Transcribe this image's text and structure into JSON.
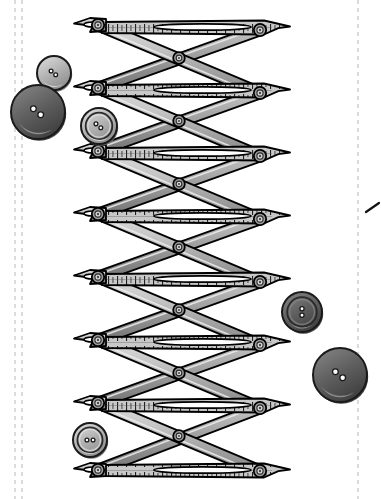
{
  "canvas": {
    "width": 381,
    "height": 499,
    "background": "#ffffff",
    "title": "Lazy-tongs scissor extension mechanism with sewing buttons"
  },
  "palette": {
    "outline": "#000000",
    "metal_light": "#d9d9d9",
    "metal_mid": "#b3b3b3",
    "metal_dark": "#8c8c8c",
    "metal_shadow": "#6e6e6e",
    "slot_white": "#ffffff",
    "button_light_face": "#b5b5b5",
    "button_light_rim": "#9a9a9a",
    "button_dark_face": "#5f5f5f",
    "button_dark_rim": "#4a4a4a",
    "button_highlight": "#cfcfcf",
    "hole_white": "#ffffff",
    "guide_dash": "#c9c9c9"
  },
  "guides": {
    "label": "dashed cutting guides",
    "lines": [
      {
        "name": "left-guide-outer",
        "x": 15,
        "y1": 0,
        "y2": 499
      },
      {
        "name": "left-guide-inner",
        "x": 22,
        "y1": 0,
        "y2": 499
      },
      {
        "name": "right-guide",
        "x": 358,
        "y1": 0,
        "y2": 499
      }
    ],
    "tick_mark": {
      "name": "corner-tick",
      "x1": 366,
      "y1": 212,
      "x2": 379,
      "y2": 204
    }
  },
  "mechanism": {
    "name": "lazy-tongs",
    "segments": 7,
    "left_pivot_x": 98,
    "right_pivot_x": 260,
    "center_pivot_x": 179,
    "left_joints_y": [
      25,
      88,
      151,
      214,
      277,
      340,
      403,
      470
    ],
    "right_joints_y": [
      30,
      93,
      156,
      219,
      282,
      345,
      408,
      471
    ],
    "center_joints_y": [
      58,
      121,
      184,
      247,
      310,
      373,
      436
    ],
    "arm_width": 11,
    "tip_left_x": 78,
    "tip_right_x": 318,
    "rivet_label": "pivot-rivet",
    "ruler_ticks_label": "scale-graduations"
  },
  "buttons": [
    {
      "name": "button-small-light-top",
      "cx": 54,
      "cy": 73,
      "r": 17,
      "style": "light",
      "rim": false,
      "holes": 2,
      "hole_layout": "diagonal",
      "label": "2-hole light button"
    },
    {
      "name": "button-large-dark-left",
      "cx": 38,
      "cy": 112,
      "r": 27,
      "style": "dark",
      "rim": false,
      "holes": 2,
      "hole_layout": "diagonal",
      "label": "2-hole large dark button"
    },
    {
      "name": "button-ringed-light-upper",
      "cx": 99,
      "cy": 126,
      "r": 18,
      "style": "light",
      "rim": true,
      "holes": 2,
      "hole_layout": "diagonal",
      "label": "2-hole ringed light button"
    },
    {
      "name": "button-medium-dark-right",
      "cx": 302,
      "cy": 312,
      "r": 20,
      "style": "dark",
      "rim": true,
      "holes": 2,
      "hole_layout": "vertical",
      "label": "2-hole medium dark button"
    },
    {
      "name": "button-large-dark-right",
      "cx": 340,
      "cy": 375,
      "r": 27,
      "style": "dark",
      "rim": false,
      "holes": 2,
      "hole_layout": "diagonal",
      "label": "2-hole large dark button"
    },
    {
      "name": "button-ringed-light-lower",
      "cx": 90,
      "cy": 440,
      "r": 17,
      "style": "light",
      "rim": true,
      "holes": 2,
      "hole_layout": "horizontal",
      "label": "2-hole ringed light button"
    }
  ]
}
